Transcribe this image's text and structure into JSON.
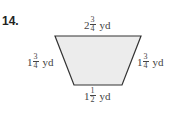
{
  "problem_number": "14.",
  "shape": {
    "type": "trapezoid",
    "fill": "#ececec",
    "stroke": "#333333",
    "points": "55,36 141,36 122,85 74,85"
  },
  "labels": {
    "top": {
      "whole": "2",
      "num": "3",
      "den": "4",
      "unit": "yd"
    },
    "left": {
      "whole": "1",
      "num": "3",
      "den": "4",
      "unit": "yd"
    },
    "right": {
      "whole": "1",
      "num": "3",
      "den": "4",
      "unit": "yd"
    },
    "bottom": {
      "whole": "1",
      "num": "1",
      "den": "2",
      "unit": "yd"
    }
  }
}
